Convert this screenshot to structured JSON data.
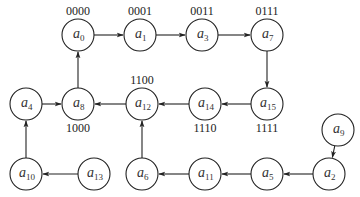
{
  "diagram": {
    "type": "directed-graph",
    "node_radius": 16,
    "nodes": [
      {
        "id": "a0",
        "base": "a",
        "sub": "0",
        "x": 78,
        "y": 35,
        "code": "0000",
        "code_pos": "above"
      },
      {
        "id": "a1",
        "base": "a",
        "sub": "1",
        "x": 140,
        "y": 35,
        "code": "0001",
        "code_pos": "above"
      },
      {
        "id": "a3",
        "base": "a",
        "sub": "3",
        "x": 202,
        "y": 35,
        "code": "0011",
        "code_pos": "above"
      },
      {
        "id": "a7",
        "base": "a",
        "sub": "7",
        "x": 267,
        "y": 35,
        "code": "0111",
        "code_pos": "above"
      },
      {
        "id": "a15",
        "base": "a",
        "sub": "15",
        "x": 267,
        "y": 104,
        "code": "1111",
        "code_pos": "below"
      },
      {
        "id": "a14",
        "base": "a",
        "sub": "14",
        "x": 205,
        "y": 104,
        "code": "1110",
        "code_pos": "below"
      },
      {
        "id": "a12",
        "base": "a",
        "sub": "12",
        "x": 142,
        "y": 104,
        "code": "1100",
        "code_pos": "above"
      },
      {
        "id": "a8",
        "base": "a",
        "sub": "8",
        "x": 78,
        "y": 104,
        "code": "1000",
        "code_pos": "below"
      },
      {
        "id": "a4",
        "base": "a",
        "sub": "4",
        "x": 26,
        "y": 104,
        "code": "",
        "code_pos": ""
      },
      {
        "id": "a10",
        "base": "a",
        "sub": "10",
        "x": 26,
        "y": 174,
        "code": "",
        "code_pos": ""
      },
      {
        "id": "a13",
        "base": "a",
        "sub": "13",
        "x": 94,
        "y": 174,
        "code": "",
        "code_pos": ""
      },
      {
        "id": "a6",
        "base": "a",
        "sub": "6",
        "x": 142,
        "y": 174,
        "code": "",
        "code_pos": ""
      },
      {
        "id": "a11",
        "base": "a",
        "sub": "11",
        "x": 205,
        "y": 174,
        "code": "",
        "code_pos": ""
      },
      {
        "id": "a5",
        "base": "a",
        "sub": "5",
        "x": 267,
        "y": 174,
        "code": "",
        "code_pos": ""
      },
      {
        "id": "a2",
        "base": "a",
        "sub": "2",
        "x": 329,
        "y": 174,
        "code": "",
        "code_pos": ""
      },
      {
        "id": "a9",
        "base": "a",
        "sub": "9",
        "x": 338,
        "y": 130,
        "code": "",
        "code_pos": ""
      }
    ],
    "edges": [
      {
        "from": "a0",
        "to": "a1"
      },
      {
        "from": "a1",
        "to": "a3"
      },
      {
        "from": "a3",
        "to": "a7"
      },
      {
        "from": "a7",
        "to": "a15"
      },
      {
        "from": "a15",
        "to": "a14"
      },
      {
        "from": "a14",
        "to": "a12"
      },
      {
        "from": "a12",
        "to": "a8"
      },
      {
        "from": "a8",
        "to": "a0"
      },
      {
        "from": "a4",
        "to": "a8"
      },
      {
        "from": "a10",
        "to": "a4"
      },
      {
        "from": "a13",
        "to": "a10"
      },
      {
        "from": "a6",
        "to": "a12"
      },
      {
        "from": "a11",
        "to": "a6"
      },
      {
        "from": "a5",
        "to": "a11"
      },
      {
        "from": "a2",
        "to": "a5"
      },
      {
        "from": "a9",
        "to": "a2"
      }
    ]
  }
}
